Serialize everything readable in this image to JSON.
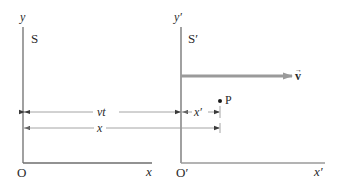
{
  "diagram": {
    "frame_s": {
      "name": "S",
      "y_axis_label": "y",
      "x_axis_label": "x",
      "origin_label": "O"
    },
    "frame_s_prime": {
      "name": "S′",
      "y_axis_label": "y′",
      "x_axis_label": "x′",
      "origin_label": "O′"
    },
    "velocity": {
      "label": "v",
      "vector_mark": "→",
      "color": "#9a9a9a"
    },
    "dimensions": {
      "vt_label": "vt",
      "x_prime_label": "x′",
      "x_label": "x"
    },
    "point": {
      "label": "P"
    },
    "colors": {
      "axis": "#6e6e6e",
      "dimension_line": "#9a9a9a",
      "text": "#2a2a2a"
    }
  }
}
